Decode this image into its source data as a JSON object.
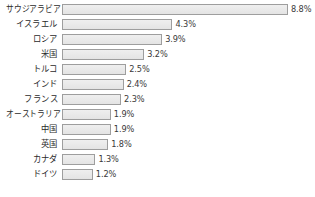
{
  "chart_data": {
    "type": "bar",
    "orientation": "horizontal",
    "title": "",
    "subtitle": "",
    "xlabel": "",
    "ylabel": "",
    "grid": false,
    "legend": false,
    "xlim": [
      0,
      8.8
    ],
    "unit": "%",
    "axis_visible": false,
    "categories": [
      "サウジアラビア",
      "イスラエル",
      "ロシア",
      "米国",
      "トルコ",
      "インド",
      "フランス",
      "オーストラリア",
      "中国",
      "英国",
      "カナダ",
      "ドイツ"
    ],
    "values": [
      8.8,
      4.3,
      3.9,
      3.2,
      2.5,
      2.4,
      2.3,
      1.9,
      1.9,
      1.8,
      1.3,
      1.2
    ],
    "value_labels": [
      "8.8%",
      "4.3%",
      "3.9%",
      "3.2%",
      "2.5%",
      "2.4%",
      "2.3%",
      "1.9%",
      "1.9%",
      "1.8%",
      "1.3%",
      "1.2%"
    ],
    "colors": {
      "bar_fill": "#e9e9e9",
      "bar_border": "#9e9e9e",
      "background": "#ffffff",
      "label_text": "#2b2b2b",
      "value_text": "#3a3a3a"
    }
  },
  "layout": {
    "bar_origin_x": 62,
    "px_per_unit": 25.68,
    "row_pitch": 15.0,
    "first_row_top": 2.5,
    "bar_height": 11
  }
}
